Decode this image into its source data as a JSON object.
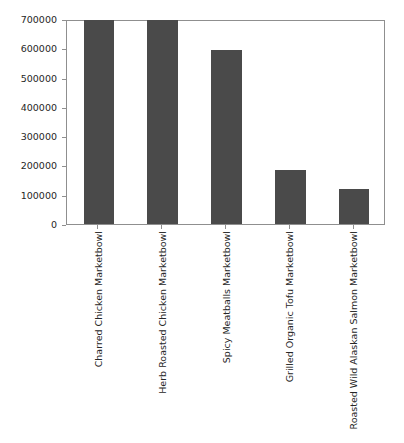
{
  "chart_data": {
    "type": "bar",
    "title": "",
    "xlabel": "",
    "ylabel": "",
    "categories": [
      "Charred Chicken Marketbowl",
      "Herb Roasted Chicken Marketbowl",
      "Spicy Meatballs Marketbowl",
      "Grilled Organic Tofu Marketbowl",
      "Roasted Wild Alaskan Salmon Marketbowl"
    ],
    "values": [
      695000,
      696000,
      593000,
      185000,
      118000
    ],
    "ylim": [
      0,
      700000
    ],
    "yticks": [
      0,
      100000,
      200000,
      300000,
      400000,
      500000,
      600000,
      700000
    ],
    "ytick_labels": [
      "0",
      "100000",
      "200000",
      "300000",
      "400000",
      "500000",
      "600000",
      "700000"
    ],
    "bar_color": "#4a4a4a",
    "grid": false,
    "legend": null,
    "axis_color": "#8f8f8f",
    "background": "#ffffff"
  }
}
